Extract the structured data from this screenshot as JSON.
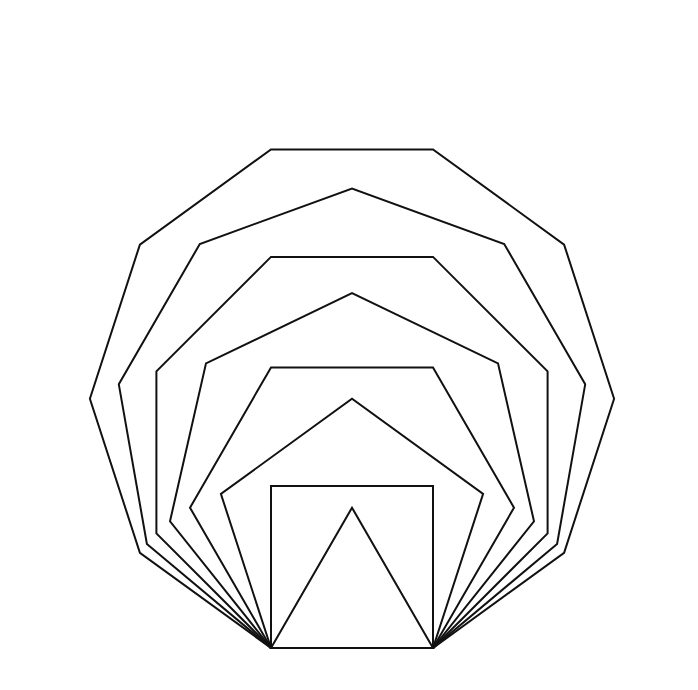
{
  "diagram": {
    "type": "nested-regular-polygons-shared-base",
    "stroke_color": "#111111",
    "background": "#ffffff",
    "base": {
      "x1": 271,
      "x2": 433,
      "y": 648
    },
    "polygons": [
      {
        "sides": 3,
        "name": "triangle"
      },
      {
        "sides": 4,
        "name": "square"
      },
      {
        "sides": 5,
        "name": "pentagon"
      },
      {
        "sides": 6,
        "name": "hexagon"
      },
      {
        "sides": 7,
        "name": "heptagon"
      },
      {
        "sides": 8,
        "name": "octagon"
      },
      {
        "sides": 9,
        "name": "nonagon"
      },
      {
        "sides": 10,
        "name": "decagon"
      }
    ]
  }
}
